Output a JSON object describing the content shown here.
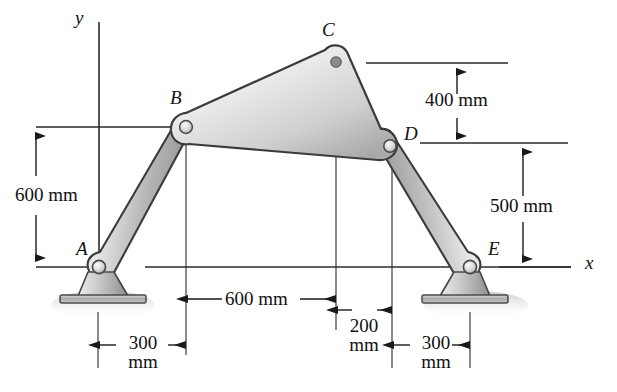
{
  "figure": {
    "axes": {
      "x_label": "x",
      "y_label": "y"
    },
    "points": [
      {
        "id": "A",
        "label": "A",
        "x": 98,
        "y": 267
      },
      {
        "id": "B",
        "label": "B",
        "x": 186,
        "y": 127
      },
      {
        "id": "C",
        "label": "C",
        "x": 336,
        "y": 63
      },
      {
        "id": "D",
        "label": "D",
        "x": 392,
        "y": 143
      },
      {
        "id": "E",
        "label": "E",
        "x": 470,
        "y": 267
      }
    ],
    "dimensions": [
      {
        "id": "height-600",
        "text": "600 mm",
        "value": 600,
        "unit": "mm",
        "orientation": "vertical",
        "from": "baseline-A",
        "to": "level-B"
      },
      {
        "id": "height-400",
        "text": "400 mm",
        "value": 400,
        "unit": "mm",
        "orientation": "vertical",
        "from": "level-C",
        "to": "level-D"
      },
      {
        "id": "height-500",
        "text": "500 mm",
        "value": 500,
        "unit": "mm",
        "orientation": "vertical",
        "from": "level-D",
        "to": "x-axis"
      },
      {
        "id": "span-600",
        "text": "600 mm",
        "value": 600,
        "unit": "mm",
        "orientation": "horizontal",
        "from": "B-column",
        "to": "C-column"
      },
      {
        "id": "span-200",
        "text": "200\nmm",
        "line1": "200",
        "line2": "mm",
        "value": 200,
        "unit": "mm",
        "orientation": "horizontal",
        "from": "C-column",
        "to": "D-column"
      },
      {
        "id": "span-300-left",
        "line1": "300",
        "line2": "mm",
        "value": 300,
        "unit": "mm",
        "orientation": "horizontal",
        "from": "A-column",
        "to": "B-column"
      },
      {
        "id": "span-300-right",
        "line1": "300",
        "line2": "mm",
        "value": 300,
        "unit": "mm",
        "orientation": "horizontal",
        "from": "D-column",
        "to": "E-column"
      }
    ],
    "members": [
      {
        "id": "link-AB",
        "name": "link-a-b",
        "from": "A",
        "to": "B"
      },
      {
        "id": "link-BCD",
        "name": "coupler-triangle-b-c-d",
        "vertices": [
          "B",
          "C",
          "D"
        ]
      },
      {
        "id": "link-DE",
        "name": "link-d-e",
        "from": "D",
        "to": "E"
      }
    ],
    "supports": [
      {
        "id": "support-A",
        "at": "A",
        "type": "pin"
      },
      {
        "id": "support-E",
        "at": "E",
        "type": "pin"
      }
    ],
    "colors": {
      "outline": "#3b3b3b",
      "metal_light": "#f2f2f2",
      "metal_mid": "#c9c9c9",
      "metal_dark": "#8f8f8f",
      "dimension_line": "#1a1a1a",
      "text": "#111111",
      "shadow": "#d9d9d9"
    }
  }
}
